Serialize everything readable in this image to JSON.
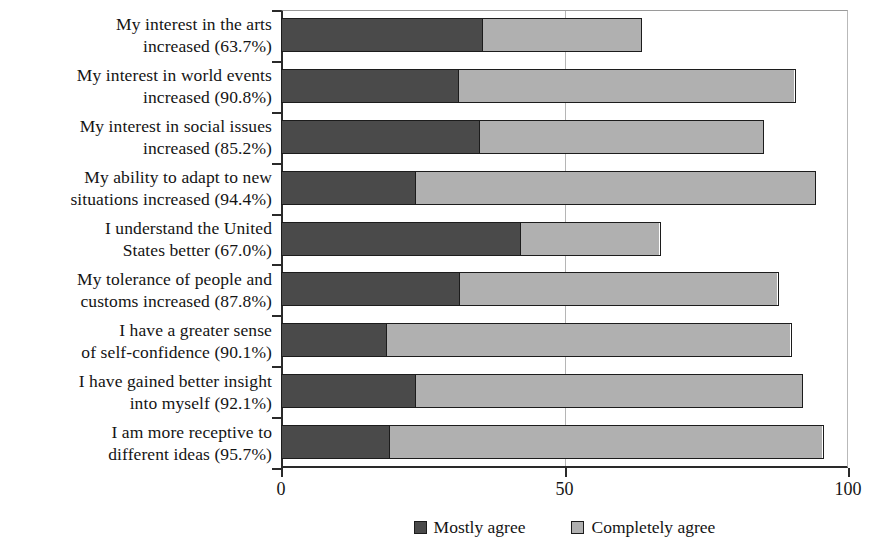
{
  "chart_data": {
    "type": "bar",
    "orientation": "horizontal",
    "stacked": true,
    "title": "",
    "xlabel": "",
    "ylabel": "",
    "xlim": [
      0,
      100
    ],
    "xticks": [
      "0",
      "50",
      "100"
    ],
    "xtick_values": [
      0,
      50,
      100
    ],
    "grid": "vertical gridline at 50",
    "legend_position": "bottom-center",
    "categories": [
      "My interest in the arts\nincreased (63.7%)",
      "My interest in world events\nincreased (90.8%)",
      "My interest in social issues\nincreased (85.2%)",
      "My ability to adapt to new\nsituations increased (94.4%)",
      "I understand the United\nStates better (67.0%)",
      "My tolerance of people and\ncustoms increased (87.8%)",
      "I have a greater sense\nof self-confidence (90.1%)",
      "I have gained better insight\ninto myself (92.1%)",
      "I am more receptive to\ndifferent ideas (95.7%)"
    ],
    "totals": [
      63.7,
      90.8,
      85.2,
      94.4,
      67.0,
      87.8,
      90.1,
      92.1,
      95.7
    ],
    "series": [
      {
        "name": "Mostly agree",
        "color": "#4a4a4a",
        "values": [
          35.6,
          31.2,
          35.0,
          23.6,
          42.2,
          31.5,
          18.5,
          23.6,
          19.0
        ]
      },
      {
        "name": "Completely agree",
        "color": "#b0b0b0",
        "values": [
          28.1,
          59.6,
          50.2,
          70.8,
          24.8,
          56.3,
          71.6,
          68.5,
          76.7
        ]
      }
    ]
  },
  "legend": {
    "items": [
      {
        "label": "Mostly agree",
        "color": "#4a4a4a"
      },
      {
        "label": "Completely agree",
        "color": "#b0b0b0"
      }
    ]
  },
  "axis": {
    "x_tick_labels": [
      "0",
      "50",
      "100"
    ]
  }
}
